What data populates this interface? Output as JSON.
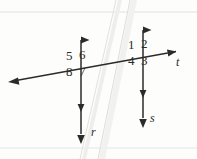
{
  "figure": {
    "kind": "geometry-diagram",
    "background_color": "#fdfdfc",
    "ink_color": "#2b2b2b",
    "scan_artifact_color": "#e8e8e6",
    "width": 197,
    "height": 159
  },
  "lines": [
    {
      "id": "line-r",
      "label": "r",
      "orientation": "vertical",
      "x": 81,
      "y_top": 31,
      "y_bottom": 144,
      "arrow_top": true,
      "arrow_bottom": true,
      "double_arrow_bottom": true,
      "label_x": 92,
      "label_y": 130
    },
    {
      "id": "line-s",
      "label": "s",
      "orientation": "vertical",
      "x": 143,
      "y_top": 21,
      "y_bottom": 128,
      "arrow_top": true,
      "arrow_bottom": true,
      "double_arrow_bottom": true,
      "label_x": 151,
      "label_y": 116
    },
    {
      "id": "line-t",
      "label": "t",
      "orientation": "transversal",
      "x_left": 8,
      "y_left": 82,
      "x_right": 183,
      "y_right": 50,
      "arrow_left": true,
      "arrow_right": true,
      "label_x": 177,
      "label_y": 60
    }
  ],
  "intersections": [
    {
      "id": "intersection-r-t",
      "x": 81,
      "y": 68
    },
    {
      "id": "intersection-s-t",
      "x": 143,
      "y": 57
    }
  ],
  "angles": [
    {
      "id": "angle-1",
      "label": "1",
      "x": 131,
      "y": 36,
      "quadrant": "upper-left",
      "at": "intersection-s-t"
    },
    {
      "id": "angle-2",
      "label": "2",
      "x": 145,
      "y": 34,
      "quadrant": "upper-right",
      "at": "intersection-s-t"
    },
    {
      "id": "angle-3",
      "label": "3",
      "x": 145,
      "y": 58,
      "quadrant": "lower-right",
      "at": "intersection-s-t"
    },
    {
      "id": "angle-4",
      "label": "4",
      "x": 131,
      "y": 58,
      "quadrant": "lower-left",
      "at": "intersection-s-t"
    },
    {
      "id": "angle-5",
      "label": "5",
      "x": 69,
      "y": 56,
      "quadrant": "upper-left",
      "at": "intersection-r-t"
    },
    {
      "id": "angle-6",
      "label": "6",
      "x": 83,
      "y": 55,
      "quadrant": "upper-right",
      "at": "intersection-r-t"
    },
    {
      "id": "angle-7",
      "label": "7",
      "x": 83,
      "y": 70,
      "quadrant": "lower-right",
      "at": "intersection-r-t"
    },
    {
      "id": "angle-8",
      "label": "8",
      "x": 69,
      "y": 70,
      "quadrant": "lower-left",
      "at": "intersection-r-t"
    }
  ],
  "scan_artifacts": {
    "top_rule_y": 12,
    "bottom_rule_y": 148,
    "streaks": [
      {
        "id": "streak-left",
        "x_top": 118,
        "x_bottom": 82,
        "width": 4
      },
      {
        "id": "streak-right",
        "x_top": 131,
        "x_bottom": 99,
        "width": 5
      }
    ]
  }
}
